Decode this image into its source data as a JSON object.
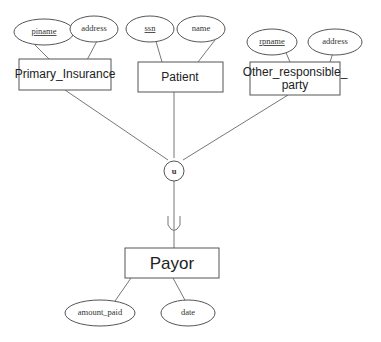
{
  "entities": {
    "primary_insurance": {
      "label": "Primary_Insurance"
    },
    "patient": {
      "label": "Patient"
    },
    "other_party": {
      "label_line1": "Other_responsible_",
      "label_line2": "party"
    },
    "payor": {
      "label": "Payor"
    }
  },
  "attributes": {
    "piname": {
      "label": "piname",
      "key": true
    },
    "pi_address": {
      "label": "address",
      "key": false
    },
    "ssn": {
      "label": "ssn",
      "key": true
    },
    "name": {
      "label": "name",
      "key": false
    },
    "rpname": {
      "label": "rpname",
      "key": true
    },
    "rp_address": {
      "label": "address",
      "key": false
    },
    "amount_paid": {
      "label": "amount_paid",
      "key": false
    },
    "date": {
      "label": "date",
      "key": false
    }
  },
  "union": {
    "label": "u"
  }
}
